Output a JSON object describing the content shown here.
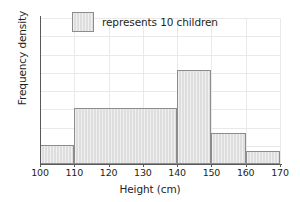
{
  "chart_data": {
    "type": "bar",
    "title": "",
    "subtitle": "",
    "xlabel": "Height (cm)",
    "ylabel": "Frequency density",
    "xlim": [
      100,
      170
    ],
    "ylim": [
      0,
      16
    ],
    "xticks": [
      100,
      110,
      120,
      130,
      140,
      150,
      160,
      170
    ],
    "yticks": [
      0,
      2,
      4,
      6,
      8,
      10,
      12,
      14,
      16
    ],
    "grid": true,
    "legend_position": "top-center",
    "legend": [
      {
        "swatch": "bar-swatch",
        "label": "represents 10 children"
      }
    ],
    "bins": [
      {
        "label": "100-110",
        "x0": 100,
        "x1": 110,
        "value": 2.1
      },
      {
        "label": "110-140",
        "x0": 110,
        "x1": 140,
        "value": 6.1
      },
      {
        "label": "140-150",
        "x0": 140,
        "x1": 150,
        "value": 10.3
      },
      {
        "label": "150-160",
        "x0": 150,
        "x1": 160,
        "value": 3.4
      },
      {
        "label": "160-170",
        "x0": 160,
        "x1": 170,
        "value": 1.4
      }
    ],
    "categories": [
      "100-110",
      "110-140",
      "140-150",
      "150-160",
      "160-170"
    ],
    "values": [
      2.1,
      6.1,
      10.3,
      3.4,
      1.4
    ],
    "colors": {
      "bar_fill": "#dedede",
      "bar_stroke": "#8c8c8e",
      "axis": "#58595b",
      "grid": "#e9e9ea",
      "text": "#231f20",
      "background": "#ffffff"
    }
  }
}
